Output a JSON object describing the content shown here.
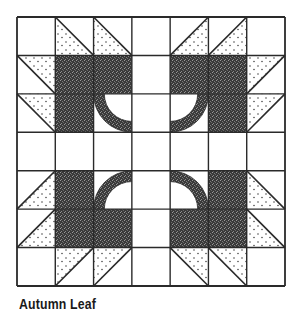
{
  "title": "Autumn Leaf",
  "quilt": {
    "grid_size": 7,
    "colors": {
      "line": "#2a2a2a",
      "dark_fill": "#3c3c3c",
      "dot": "#4a4a4a",
      "background": "#ffffff"
    },
    "cells": [
      [
        "white",
        "hst:tlbr:bl",
        "hst:tlbr:bl",
        "white",
        "hst:trbl:br",
        "hst:trbl:br",
        "white"
      ],
      [
        "hst:tlbr:tr",
        "dark",
        "dark",
        "white",
        "dark",
        "dark",
        "hst:trbl:tl"
      ],
      [
        "hst:tlbr:tr",
        "dark",
        "stem:tr",
        "white",
        "stem:tl",
        "dark",
        "hst:trbl:tl"
      ],
      [
        "white",
        "white",
        "white",
        "white",
        "white",
        "white",
        "white"
      ],
      [
        "hst:trbl:br",
        "dark",
        "stem:br",
        "white",
        "stem:bl",
        "dark",
        "hst:tlbr:bl"
      ],
      [
        "hst:trbl:br",
        "dark",
        "dark",
        "white",
        "dark",
        "dark",
        "hst:tlbr:bl"
      ],
      [
        "white",
        "hst:trbl:tl",
        "hst:trbl:tl",
        "white",
        "hst:tlbr:tr",
        "hst:tlbr:tr",
        "white"
      ]
    ],
    "legend": {
      "white": "plain white patch",
      "dark": "dark speckled patch",
      "hst": "half-square triangle: diagonal direction, dotted corner",
      "stem": "quarter-circle stem band centered at given corner"
    }
  }
}
